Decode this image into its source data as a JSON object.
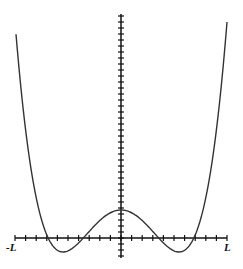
{
  "figure": {
    "x_axis": {
      "left_label": "-L",
      "right_label": "L"
    },
    "curve": {
      "shape": "double-well quartic",
      "color": "#333333"
    },
    "axis_color": "#111111"
  }
}
